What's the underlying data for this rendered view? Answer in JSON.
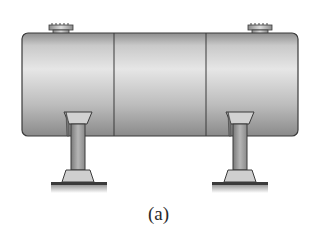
{
  "figure": {
    "caption": "(a)",
    "components": {
      "vessel": {
        "sections": 3,
        "color": "#bdbdbd",
        "outline": "#3a3a3a"
      },
      "nozzles": [
        {
          "position": "left-top"
        },
        {
          "position": "right-top"
        }
      ],
      "supports": [
        {
          "position": "left"
        },
        {
          "position": "right"
        }
      ]
    }
  }
}
